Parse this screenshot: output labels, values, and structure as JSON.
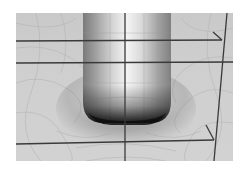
{
  "scene": {
    "description": "3D shaded surface render of a rounded cylindrical bump rising from a meshed ground plane, with construction lines",
    "frame": {
      "x": 16,
      "y": 13,
      "width": 217,
      "height": 148
    },
    "colors": {
      "background": "#ffffff",
      "plane": "#cdcdcd",
      "mesh_line": "#b4b4b4",
      "construction_line": "#3a3a3a",
      "shadow": "#111111",
      "highlight": "#f4f4f4"
    },
    "construction_lines": {
      "vertical_center_x": 125,
      "horizontal_y": [
        41,
        63,
        140
      ],
      "slanted_edge": {
        "top": [
          227,
          13
        ],
        "bottom": [
          214,
          161
        ]
      }
    },
    "object": {
      "type": "rounded-cylinder-bump",
      "left_x": 83,
      "right_x": 170,
      "base_y": 122
    }
  }
}
